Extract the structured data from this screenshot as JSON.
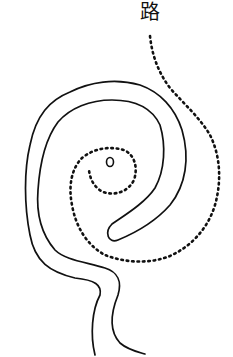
{
  "drawing": {
    "label": "路",
    "description": "Hand-drawn spiral path with dotted trail",
    "colors": {
      "ink": "#111111",
      "background": "#ffffff"
    },
    "center_marker": "circle"
  }
}
